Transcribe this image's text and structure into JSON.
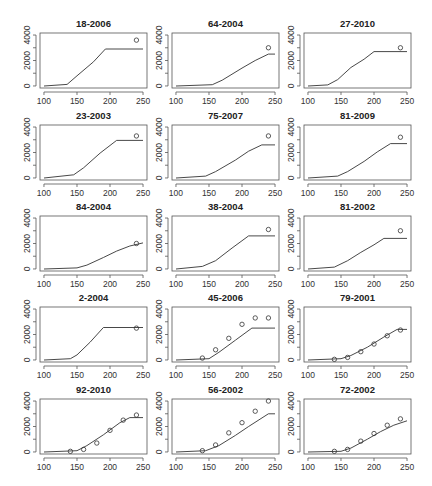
{
  "chart_data": {
    "type": "line",
    "layout": {
      "rows": 5,
      "cols": 3
    },
    "xlim": [
      100,
      250
    ],
    "ylim": [
      0,
      4000
    ],
    "x_ticks": [
      100,
      150,
      200,
      250
    ],
    "y_ticks": [
      0,
      2000,
      4000
    ],
    "panels": [
      {
        "title": "18-2006",
        "line": [
          [
            100,
            0
          ],
          [
            135,
            120
          ],
          [
            150,
            800
          ],
          [
            175,
            1900
          ],
          [
            193,
            2900
          ],
          [
            250,
            2900
          ]
        ],
        "points": [
          [
            240,
            3600
          ]
        ]
      },
      {
        "title": "64-2004",
        "line": [
          [
            100,
            0
          ],
          [
            155,
            100
          ],
          [
            170,
            450
          ],
          [
            200,
            1400
          ],
          [
            220,
            2000
          ],
          [
            240,
            2500
          ],
          [
            250,
            2500
          ]
        ],
        "points": [
          [
            240,
            3000
          ]
        ]
      },
      {
        "title": "27-2010",
        "line": [
          [
            100,
            0
          ],
          [
            130,
            80
          ],
          [
            145,
            500
          ],
          [
            165,
            1450
          ],
          [
            185,
            2100
          ],
          [
            200,
            2700
          ],
          [
            250,
            2700
          ]
        ],
        "points": [
          [
            240,
            3000
          ]
        ]
      },
      {
        "title": "23-2003",
        "line": [
          [
            100,
            0
          ],
          [
            145,
            250
          ],
          [
            160,
            800
          ],
          [
            185,
            1950
          ],
          [
            210,
            2950
          ],
          [
            250,
            2950
          ]
        ],
        "points": [
          [
            240,
            3300
          ]
        ]
      },
      {
        "title": "75-2007",
        "line": [
          [
            100,
            0
          ],
          [
            145,
            150
          ],
          [
            160,
            500
          ],
          [
            190,
            1400
          ],
          [
            210,
            2100
          ],
          [
            230,
            2600
          ],
          [
            250,
            2600
          ]
        ],
        "points": [
          [
            240,
            3300
          ]
        ]
      },
      {
        "title": "81-2009",
        "line": [
          [
            100,
            0
          ],
          [
            145,
            150
          ],
          [
            160,
            500
          ],
          [
            185,
            1300
          ],
          [
            205,
            2050
          ],
          [
            225,
            2700
          ],
          [
            250,
            2700
          ]
        ],
        "points": [
          [
            240,
            3200
          ]
        ]
      },
      {
        "title": "84-2004",
        "line": [
          [
            100,
            0
          ],
          [
            150,
            80
          ],
          [
            165,
            300
          ],
          [
            190,
            900
          ],
          [
            210,
            1400
          ],
          [
            230,
            1800
          ],
          [
            250,
            2050
          ]
        ],
        "points": [
          [
            240,
            2000
          ]
        ]
      },
      {
        "title": "38-2004",
        "line": [
          [
            100,
            0
          ],
          [
            140,
            200
          ],
          [
            160,
            650
          ],
          [
            185,
            1650
          ],
          [
            210,
            2600
          ],
          [
            250,
            2600
          ]
        ],
        "points": [
          [
            240,
            3100
          ]
        ]
      },
      {
        "title": "81-2002",
        "line": [
          [
            100,
            0
          ],
          [
            140,
            150
          ],
          [
            160,
            650
          ],
          [
            180,
            1300
          ],
          [
            200,
            1900
          ],
          [
            215,
            2400
          ],
          [
            250,
            2400
          ]
        ],
        "points": [
          [
            240,
            3000
          ]
        ]
      },
      {
        "title": "2-2004",
        "line": [
          [
            100,
            0
          ],
          [
            140,
            100
          ],
          [
            150,
            400
          ],
          [
            170,
            1400
          ],
          [
            190,
            2550
          ],
          [
            250,
            2550
          ]
        ],
        "points": [
          [
            240,
            2500
          ]
        ]
      },
      {
        "title": "45-2006",
        "line": [
          [
            100,
            0
          ],
          [
            150,
            100
          ],
          [
            165,
            600
          ],
          [
            190,
            1550
          ],
          [
            215,
            2500
          ],
          [
            250,
            2500
          ]
        ],
        "points": [
          [
            140,
            150
          ],
          [
            160,
            800
          ],
          [
            180,
            1700
          ],
          [
            200,
            2800
          ],
          [
            220,
            3300
          ],
          [
            240,
            3300
          ]
        ]
      },
      {
        "title": "79-2001",
        "line": [
          [
            100,
            0
          ],
          [
            150,
            100
          ],
          [
            165,
            350
          ],
          [
            190,
            1000
          ],
          [
            215,
            1800
          ],
          [
            235,
            2400
          ],
          [
            250,
            2400
          ]
        ],
        "points": [
          [
            140,
            50
          ],
          [
            160,
            200
          ],
          [
            180,
            650
          ],
          [
            200,
            1250
          ],
          [
            220,
            1900
          ],
          [
            240,
            2350
          ]
        ]
      },
      {
        "title": "92-2010",
        "line": [
          [
            100,
            0
          ],
          [
            150,
            100
          ],
          [
            165,
            500
          ],
          [
            190,
            1350
          ],
          [
            215,
            2300
          ],
          [
            230,
            2700
          ],
          [
            250,
            2700
          ]
        ],
        "points": [
          [
            140,
            50
          ],
          [
            160,
            200
          ],
          [
            180,
            700
          ],
          [
            200,
            1700
          ],
          [
            220,
            2500
          ],
          [
            240,
            2900
          ]
        ]
      },
      {
        "title": "56-2002",
        "line": [
          [
            100,
            0
          ],
          [
            145,
            100
          ],
          [
            165,
            500
          ],
          [
            190,
            1300
          ],
          [
            210,
            2000
          ],
          [
            240,
            3000
          ],
          [
            250,
            3000
          ]
        ],
        "points": [
          [
            140,
            100
          ],
          [
            160,
            550
          ],
          [
            180,
            1500
          ],
          [
            200,
            2300
          ],
          [
            220,
            3200
          ],
          [
            240,
            4000
          ]
        ]
      },
      {
        "title": "72-2002",
        "line": [
          [
            100,
            0
          ],
          [
            150,
            50
          ],
          [
            165,
            300
          ],
          [
            190,
            1000
          ],
          [
            210,
            1600
          ],
          [
            230,
            2100
          ],
          [
            250,
            2450
          ]
        ],
        "points": [
          [
            140,
            50
          ],
          [
            160,
            200
          ],
          [
            180,
            850
          ],
          [
            200,
            1450
          ],
          [
            220,
            2100
          ],
          [
            240,
            2600
          ]
        ]
      }
    ]
  }
}
